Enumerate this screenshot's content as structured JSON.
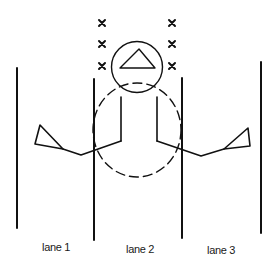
{
  "diagram": {
    "type": "swim lane overhead diagram",
    "lanes": [
      {
        "label": "lane 1"
      },
      {
        "label": "lane 2"
      },
      {
        "label": "lane 3"
      }
    ],
    "markers": {
      "left_column_count": 3,
      "right_column_count": 3,
      "glyph": "×"
    },
    "elements": {
      "head_circle_icon": "circle with triangle",
      "dashed_circle": "dashed ellipse around body",
      "left_arm_flag": "triangle flag",
      "right_arm_flag": "triangle flag"
    },
    "colors": {
      "stroke": "#111111",
      "background": "#ffffff"
    }
  }
}
